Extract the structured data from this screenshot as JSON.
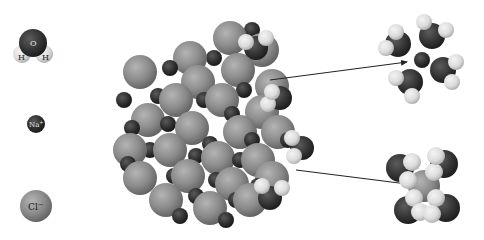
{
  "legend": {
    "water": {
      "label_o": "O",
      "label_h1": "H",
      "label_h2": "H",
      "cx": 32,
      "cy": 44
    },
    "sodium": {
      "label": "Na",
      "charge": "+",
      "cx": 36,
      "cy": 122
    },
    "chloride": {
      "label": "Cl",
      "charge": "−",
      "cx": 36,
      "cy": 206
    }
  },
  "colors": {
    "background": "#ffffff",
    "chloride": "#8c8c8c",
    "chloride_highlight": "#b4b4b4",
    "chloride_shadow": "#5e5e5e",
    "sodium": "#2e2e2e",
    "sodium_highlight": "#5a5a5a",
    "oxygen": "#333333",
    "oxygen_highlight": "#5c5c5c",
    "hydrogen": "#e4e4e4",
    "hydrogen_shadow": "#a8a8a8",
    "arrow": "#222222"
  },
  "arrows": [
    {
      "name": "arrow-to-hydrated-sodium",
      "x1": 270,
      "y1": 80,
      "x2": 407,
      "y2": 62
    },
    {
      "name": "arrow-to-hydrated-chloride",
      "x1": 296,
      "y1": 170,
      "x2": 423,
      "y2": 186
    }
  ],
  "hydrated_sodium": {
    "center": {
      "x": 422,
      "y": 60,
      "r": 8
    },
    "waters": [
      {
        "ox": 398,
        "oy": 44,
        "h": [
          [
            386,
            48
          ],
          [
            396,
            32
          ]
        ]
      },
      {
        "ox": 432,
        "oy": 36,
        "h": [
          [
            424,
            22
          ],
          [
            446,
            30
          ]
        ]
      },
      {
        "ox": 443,
        "oy": 70,
        "h": [
          [
            456,
            62
          ],
          [
            452,
            82
          ]
        ]
      },
      {
        "ox": 410,
        "oy": 82,
        "h": [
          [
            396,
            78
          ],
          [
            412,
            96
          ]
        ]
      }
    ]
  },
  "hydrated_chloride": {
    "center": {
      "x": 424,
      "y": 186,
      "r": 16
    },
    "waters": [
      {
        "ox": 400,
        "oy": 168,
        "h": [
          [
            408,
            180
          ],
          [
            412,
            162
          ]
        ]
      },
      {
        "ox": 444,
        "oy": 164,
        "h": [
          [
            434,
            172
          ],
          [
            436,
            156
          ]
        ]
      },
      {
        "ox": 408,
        "oy": 210,
        "h": [
          [
            414,
            198
          ],
          [
            420,
            212
          ]
        ]
      },
      {
        "ox": 446,
        "oy": 208,
        "h": [
          [
            436,
            198
          ],
          [
            432,
            214
          ]
        ]
      }
    ]
  },
  "crystal": {
    "cl_radius": 17,
    "na_radius": 8,
    "chlorides": [
      [
        230,
        38
      ],
      [
        190,
        58
      ],
      [
        262,
        50
      ],
      [
        140,
        72
      ],
      [
        198,
        82
      ],
      [
        238,
        70
      ],
      [
        272,
        86
      ],
      [
        176,
        100
      ],
      [
        222,
        100
      ],
      [
        262,
        112
      ],
      [
        148,
        120
      ],
      [
        130,
        150
      ],
      [
        192,
        128
      ],
      [
        240,
        132
      ],
      [
        278,
        132
      ],
      [
        170,
        150
      ],
      [
        218,
        158
      ],
      [
        258,
        160
      ],
      [
        140,
        178
      ],
      [
        188,
        176
      ],
      [
        232,
        184
      ],
      [
        272,
        178
      ],
      [
        166,
        200
      ],
      [
        210,
        208
      ],
      [
        250,
        200
      ]
    ],
    "sodiums": [
      [
        170,
        68
      ],
      [
        214,
        58
      ],
      [
        252,
        30
      ],
      [
        158,
        96
      ],
      [
        204,
        100
      ],
      [
        244,
        90
      ],
      [
        124,
        100
      ],
      [
        194,
        122
      ],
      [
        232,
        114
      ],
      [
        270,
        110
      ],
      [
        132,
        128
      ],
      [
        168,
        124
      ],
      [
        210,
        144
      ],
      [
        252,
        140
      ],
      [
        150,
        150
      ],
      [
        196,
        156
      ],
      [
        240,
        160
      ],
      [
        288,
        140
      ],
      [
        128,
        164
      ],
      [
        174,
        176
      ],
      [
        216,
        180
      ],
      [
        258,
        186
      ],
      [
        196,
        196
      ],
      [
        236,
        200
      ],
      [
        180,
        216
      ],
      [
        226,
        220
      ]
    ],
    "attached_waters": [
      {
        "ox": 256,
        "oy": 48,
        "h": [
          [
            246,
            42
          ],
          [
            266,
            38
          ]
        ]
      },
      {
        "ox": 280,
        "oy": 98,
        "h": [
          [
            268,
            104
          ],
          [
            272,
            92
          ]
        ]
      },
      {
        "ox": 302,
        "oy": 148,
        "h": [
          [
            292,
            138
          ],
          [
            294,
            156
          ]
        ]
      },
      {
        "ox": 270,
        "oy": 198,
        "h": [
          [
            262,
            186
          ],
          [
            282,
            188
          ]
        ]
      }
    ]
  }
}
